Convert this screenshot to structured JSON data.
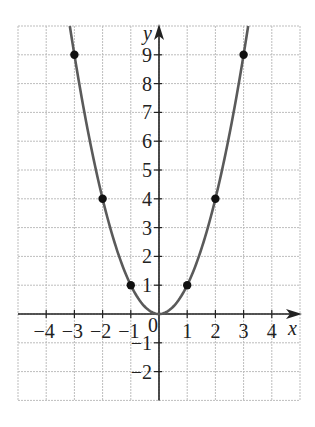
{
  "chart_data": {
    "type": "line",
    "title": "",
    "function": "y = x^2",
    "xlabel": "x",
    "ylabel": "y",
    "xlim": [
      -5,
      5
    ],
    "ylim": [
      -3,
      10
    ],
    "grid": true,
    "x_ticks": [
      -4,
      -3,
      -2,
      -1,
      0,
      1,
      2,
      3,
      4
    ],
    "x_tick_labels": [
      "−4",
      "−3",
      "−2",
      "−1",
      "0",
      "1",
      "2",
      "3",
      "4"
    ],
    "y_ticks": [
      -2,
      -1,
      1,
      2,
      3,
      4,
      5,
      6,
      7,
      8,
      9
    ],
    "y_tick_labels": [
      "−2",
      "−1",
      "1",
      "2",
      "3",
      "4",
      "5",
      "6",
      "7",
      "8",
      "9"
    ],
    "points": [
      {
        "x": -3,
        "y": 9
      },
      {
        "x": -2,
        "y": 4
      },
      {
        "x": -1,
        "y": 1
      },
      {
        "x": 0,
        "y": 0
      },
      {
        "x": 1,
        "y": 1
      },
      {
        "x": 2,
        "y": 4
      },
      {
        "x": 3,
        "y": 9
      }
    ],
    "series": [
      {
        "name": "y = x²",
        "x": [
          -3,
          -2,
          -1,
          0,
          1,
          2,
          3
        ],
        "values": [
          9,
          4,
          1,
          0,
          1,
          4,
          9
        ]
      }
    ],
    "colors": {
      "curve": "#5a5a5a",
      "points": "#111111",
      "axes": "#222222",
      "grid": "#bdbdbd"
    }
  }
}
